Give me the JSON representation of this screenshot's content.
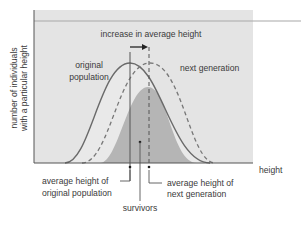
{
  "diagram": {
    "y_axis_label_line1": "number of individuals",
    "y_axis_label_line2": "with a particular height",
    "x_axis_label": "height",
    "arrow_label": "increase in average height",
    "curves": {
      "original": {
        "label_line1": "original",
        "label_line2": "population",
        "style": "solid"
      },
      "next_generation": {
        "label": "next generation",
        "style": "dashed"
      },
      "survivors": {
        "label": "survivors",
        "style": "filled"
      }
    },
    "annotations": {
      "avg_original_line1": "average height of",
      "avg_original_line2": "original population",
      "avg_next_line1": "average height of",
      "avg_next_line2": "next generation",
      "survivors": "survivors"
    },
    "colors": {
      "plot_background": "#e4e4e4",
      "survivors_fill": "#b9b9b9",
      "curve_stroke": "#666666",
      "axis": "#555555"
    }
  }
}
